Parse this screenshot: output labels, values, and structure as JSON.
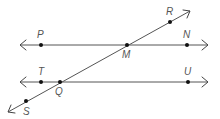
{
  "diagram": {
    "type": "geometry-parallel-lines-transversal",
    "line_color": "#555555",
    "point_color": "#111111",
    "lines": [
      {
        "name": "upper-line",
        "from": [
          20,
          45
        ],
        "to": [
          208,
          45
        ],
        "both_arrows": true
      },
      {
        "name": "lower-line",
        "from": [
          20,
          82
        ],
        "to": [
          208,
          82
        ],
        "both_arrows": true
      },
      {
        "name": "transversal",
        "from": [
          8,
          112
        ],
        "to": [
          190,
          11
        ],
        "both_arrows": true
      }
    ],
    "points": [
      {
        "label": "P",
        "x": 41,
        "y": 45,
        "label_x": 38,
        "label_y": 37
      },
      {
        "label": "M",
        "x": 127,
        "y": 45,
        "label_x": 123,
        "label_y": 58
      },
      {
        "label": "N",
        "x": 187,
        "y": 45,
        "label_x": 183,
        "label_y": 37
      },
      {
        "label": "R",
        "x": 170,
        "y": 22,
        "label_x": 165,
        "label_y": 15
      },
      {
        "label": "T",
        "x": 41,
        "y": 82,
        "label_x": 38,
        "label_y": 74
      },
      {
        "label": "Q",
        "x": 60,
        "y": 82,
        "label_x": 55,
        "label_y": 95
      },
      {
        "label": "U",
        "x": 188,
        "y": 82,
        "label_x": 184,
        "label_y": 74
      },
      {
        "label": "S",
        "x": 26,
        "y": 101,
        "label_x": 24,
        "label_y": 115
      }
    ]
  },
  "labels": {
    "P": "P",
    "M": "M",
    "N": "N",
    "R": "R",
    "T": "T",
    "Q": "Q",
    "U": "U",
    "S": "S"
  }
}
